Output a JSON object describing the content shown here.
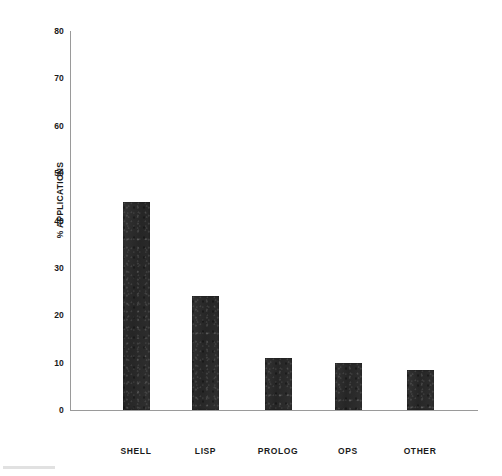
{
  "chart_data": {
    "type": "bar",
    "title": "",
    "subtitle": "",
    "xlabel": "",
    "ylabel": "% APPLICATIONS",
    "categories": [
      "SHELL",
      "LISP",
      "PROLOG",
      "OPS",
      "OTHER"
    ],
    "values": [
      44,
      24,
      11,
      10,
      8.5
    ],
    "ylim": [
      0,
      80
    ],
    "ytick_step": 10,
    "ytick_labels": [
      "80",
      "70",
      "60",
      "50",
      "40",
      "30",
      "20",
      "10",
      "0"
    ],
    "ytick_values": [
      80,
      70,
      60,
      50,
      40,
      30,
      20,
      10,
      0
    ],
    "grid": false,
    "legend": false,
    "legend_position": "none",
    "bar_color": "#2e2e2e",
    "axis_color": "#9a9a9a",
    "background_color": "#ffffff",
    "text_color": "#1a1a1a",
    "series": [
      {
        "name": "% Applications",
        "values": [
          44,
          24,
          11,
          10,
          8.5
        ]
      }
    ]
  }
}
